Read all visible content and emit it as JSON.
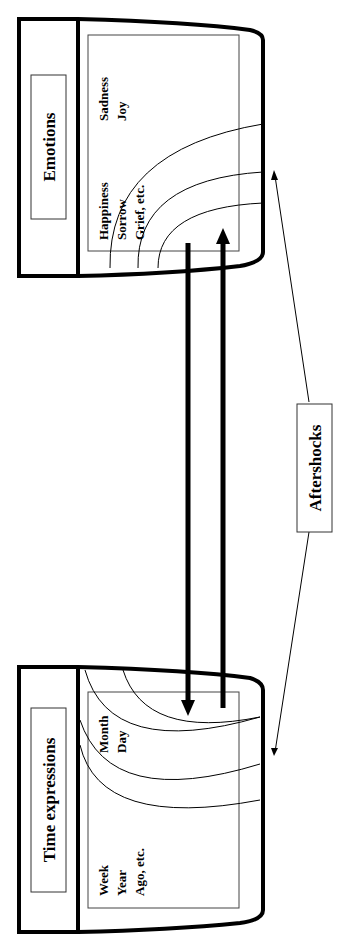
{
  "diagram": {
    "orientation": "rotated-90-ccw",
    "colors": {
      "stroke": "#000000",
      "background": "#ffffff",
      "frame": "#333333"
    },
    "top_block": {
      "title": "Emotions",
      "items_col1": [
        "Happiness",
        "Sorrow",
        "Grief, etc."
      ],
      "items_col2": [
        "Sadness",
        "Joy"
      ]
    },
    "bottom_block": {
      "title": "Time expressions",
      "items_col1": [
        "Month",
        "Day"
      ],
      "items_col2": [
        "Week",
        "Year",
        "Ago, etc."
      ]
    },
    "connector": {
      "label": "Aftershocks"
    },
    "arrows": [
      {
        "from": "Emotions",
        "to": "Time expressions",
        "direction": "down"
      },
      {
        "from": "Time expressions",
        "to": "Emotions",
        "direction": "up"
      }
    ]
  }
}
